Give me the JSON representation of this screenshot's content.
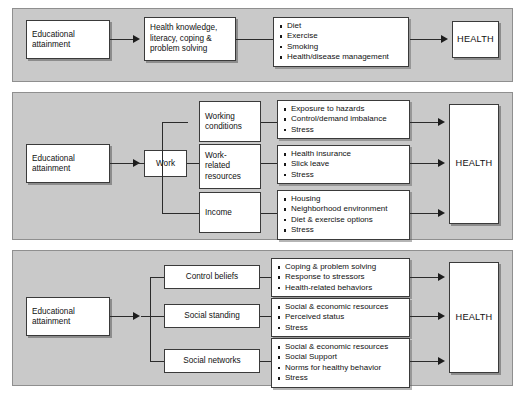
{
  "figure": {
    "background_color": "#ffffff",
    "panel_color": "#c9c9c9",
    "box_color": "#ffffff",
    "line_color": "#2b2b2b"
  },
  "panels": [
    {
      "id": "behavioral-pathway",
      "source": "Educational\nattainment",
      "mediators": [
        "Health knowledge,\nliteracy, coping &\nproblem solving"
      ],
      "outcome_groups": [
        {
          "items": [
            "Diet",
            "Exercise",
            "Smoking",
            "Health/disease management"
          ]
        }
      ],
      "outcome": "HEALTH"
    },
    {
      "id": "work-pathway",
      "source": "Educational\nattainment",
      "hub": "Work",
      "mediators": [
        "Working\nconditions",
        "Work-\nrelated\nresources",
        "Income"
      ],
      "outcome_groups": [
        {
          "items": [
            "Exposure to hazards",
            "Control/demand imbalance",
            "Stress"
          ]
        },
        {
          "items": [
            "Health insurance",
            "Slick leave",
            "Stress"
          ]
        },
        {
          "items": [
            "Housing",
            "Neighborhood environment",
            "Diet & exercise options",
            "Stress"
          ]
        }
      ],
      "outcome": "HEALTH"
    },
    {
      "id": "social-psychological-pathway",
      "source": "Educational\nattainment",
      "mediators": [
        "Control beliefs",
        "Social standing",
        "Social networks"
      ],
      "outcome_groups": [
        {
          "items": [
            "Coping & problem solving",
            "Response to stressors",
            "Health-related behaviors"
          ]
        },
        {
          "items": [
            "Social & economic resources",
            "Perceived status",
            "Stress"
          ]
        },
        {
          "items": [
            "Social & economic resources",
            "Social Support",
            "Norms for healthy behavior",
            "Stress"
          ]
        }
      ],
      "outcome": "HEALTH"
    }
  ]
}
